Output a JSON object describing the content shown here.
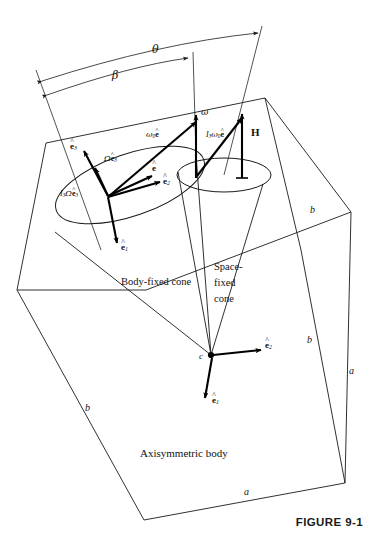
{
  "figure": {
    "caption": "FIGURE 9-1",
    "body_label": "Axisymmetric body",
    "apex_label": "c",
    "cones": {
      "body_fixed": "Body-fixed cone",
      "space_fixed_line1": "Space-",
      "space_fixed_line2": "fixed",
      "space_fixed_line3": "cone"
    },
    "angles": {
      "theta": "θ",
      "beta": "β"
    },
    "edges": {
      "b_upper_right": "b",
      "b_lower_right": "b",
      "b_lower_left": "b",
      "a_right_vertical": "a",
      "a_bottom": "a"
    },
    "vectors": {
      "omega": "ω",
      "omega0_e_hat": {
        "greek": "ω",
        "sub": "0",
        "unit": "e"
      },
      "I3_omega0_e_hat": {
        "roman": "I",
        "sub1": "3",
        "greek": "ω",
        "sub2": "0",
        "unit": "e"
      },
      "angular_momentum": "H",
      "e_hat": {
        "unit": "e"
      },
      "e_hat_1_top": {
        "unit": "e",
        "sub": "1"
      },
      "e_hat_2_top": {
        "unit": "e",
        "sub": "2"
      },
      "e_hat_3_top": {
        "unit": "e",
        "sub": "3"
      },
      "e_hat_1_bottom": {
        "unit": "e",
        "sub": "1"
      },
      "e_hat_2_bottom": {
        "unit": "e",
        "sub": "2"
      },
      "Omega_e_hat_3": {
        "greek": "Ω",
        "unit": "e",
        "sub": "3"
      },
      "I3_Omega_e_hat_3": {
        "roman": "I",
        "sub1": "3",
        "greek": "Ω",
        "unit": "e",
        "sub2": "3"
      }
    }
  }
}
